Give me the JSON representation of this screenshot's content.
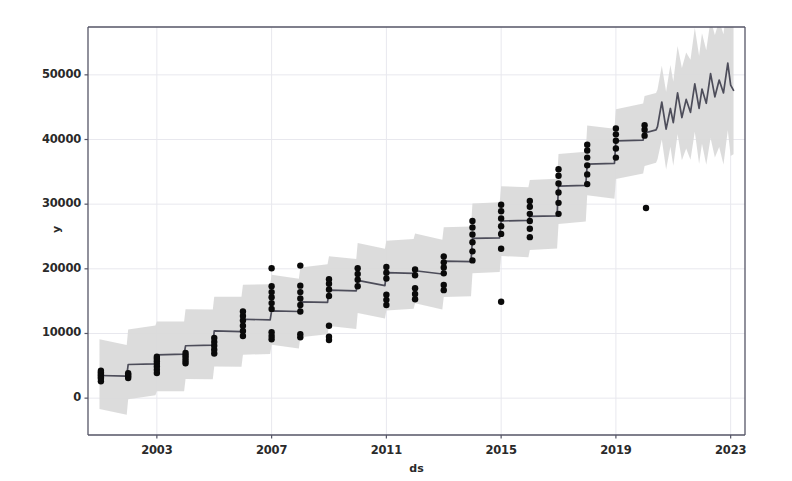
{
  "chart_data": {
    "type": "line",
    "title": "",
    "subtitle": "",
    "xlabel": "ds",
    "ylabel": "y",
    "grid": true,
    "legend_position": "none",
    "xlim": [
      2000.6,
      2023.5
    ],
    "ylim": [
      -5700,
      57400
    ],
    "xticks": [
      2003,
      2007,
      2011,
      2015,
      2019,
      2023
    ],
    "xtick_labels": [
      "2003",
      "2007",
      "2011",
      "2015",
      "2019",
      "2023"
    ],
    "yticks": [
      0,
      10000,
      20000,
      30000,
      40000,
      50000
    ],
    "ytick_labels": [
      "0",
      "10000",
      "20000",
      "30000",
      "40000",
      "50000"
    ],
    "colors": {
      "forecast_line": "#4d4d5a",
      "uncertainty_band": "#d9d9d9",
      "observed_points": "#0a0a0a",
      "grid": "#e8e8ee",
      "axis": "#555566",
      "background": "#ffffff"
    },
    "series": [
      {
        "name": "yhat",
        "kind": "step-line",
        "description": "Prophet forecast trend: annual step segments through history, then yearly-seasonal oscillation in the forecast horizon",
        "x": [
          2001.0,
          2001.95,
          2002.0,
          2002.95,
          2003.0,
          2003.95,
          2004.0,
          2004.95,
          2005.0,
          2005.95,
          2006.0,
          2006.95,
          2007.0,
          2007.95,
          2008.0,
          2008.95,
          2009.0,
          2009.95,
          2010.0,
          2010.95,
          2011.0,
          2011.95,
          2012.0,
          2012.95,
          2013.0,
          2013.95,
          2014.0,
          2014.95,
          2015.0,
          2015.95,
          2016.0,
          2016.95,
          2017.0,
          2017.95,
          2018.0,
          2018.95,
          2019.0,
          2019.95,
          2020.0,
          2020.4
        ],
        "y": [
          3500,
          3400,
          5200,
          5300,
          6700,
          6800,
          8100,
          8200,
          10400,
          10300,
          12200,
          12100,
          13500,
          13400,
          14900,
          14800,
          16700,
          16600,
          18200,
          17400,
          19400,
          19300,
          19700,
          19200,
          21200,
          21100,
          24700,
          24800,
          27400,
          27500,
          28100,
          28200,
          32800,
          32900,
          36200,
          36300,
          39800,
          39900,
          41000,
          41500
        ]
      },
      {
        "name": "yhat_forecast",
        "kind": "seasonal-line",
        "description": "Forecast extension 2020.4 to 2023.1 with repeating yearly peaks and troughs",
        "x": [
          2020.45,
          2020.6,
          2020.75,
          2020.9,
          2021.0,
          2021.15,
          2021.3,
          2021.45,
          2021.6,
          2021.75,
          2021.9,
          2022.0,
          2022.15,
          2022.3,
          2022.45,
          2022.6,
          2022.75,
          2022.9,
          2023.0,
          2023.1
        ],
        "y": [
          42000,
          45800,
          41600,
          44800,
          42600,
          47200,
          43400,
          46200,
          44200,
          48600,
          44800,
          47800,
          45600,
          50200,
          46600,
          49200,
          47200,
          51800,
          48400,
          47600
        ]
      }
    ],
    "uncertainty": {
      "name": "yhat_lower / yhat_upper",
      "band_width_low": 5400,
      "band_width_high": 5400,
      "description": "Shaded gray 80% uncertainty interval around yhat; widens noticeably in the forecast horizon after 2020.4"
    },
    "observed": {
      "name": "y (observed)",
      "marker": "filled-circle",
      "marker_size": 3.2,
      "description": "Vertical clusters of observed annual datapoints at each step boundary",
      "clusters": [
        {
          "x": 2001.05,
          "values": [
            2600,
            3000,
            3250,
            3500,
            3750,
            4000,
            4250
          ]
        },
        {
          "x": 2002.0,
          "values": [
            3100,
            3400,
            3600,
            3850
          ]
        },
        {
          "x": 2003.0,
          "values": [
            3900,
            4400,
            4900,
            5300,
            5700,
            6100,
            6400
          ]
        },
        {
          "x": 2004.0,
          "values": [
            5400,
            5800,
            6200,
            6600,
            7000
          ]
        },
        {
          "x": 2005.0,
          "values": [
            6900,
            7500,
            8100,
            8700,
            9300
          ]
        },
        {
          "x": 2006.0,
          "values": [
            9600,
            10400,
            11200,
            12000,
            12700,
            13400
          ]
        },
        {
          "x": 2007.0,
          "values": [
            9100,
            9600,
            10200,
            13800,
            14700,
            15600,
            16400,
            17300,
            20100
          ]
        },
        {
          "x": 2008.0,
          "values": [
            9400,
            9900,
            13400,
            14400,
            15400,
            16400,
            17400,
            20500
          ]
        },
        {
          "x": 2009.0,
          "values": [
            9000,
            9500,
            11200,
            15800,
            16800,
            17700,
            18400
          ]
        },
        {
          "x": 2010.0,
          "values": [
            17300,
            18300,
            19200,
            20100
          ]
        },
        {
          "x": 2011.0,
          "values": [
            14400,
            15200,
            16000,
            18500,
            19400,
            20300
          ]
        },
        {
          "x": 2012.0,
          "values": [
            15300,
            16100,
            17000,
            19000,
            19900
          ]
        },
        {
          "x": 2013.0,
          "values": [
            16700,
            17500,
            19300,
            20200,
            21000,
            21900
          ]
        },
        {
          "x": 2014.0,
          "values": [
            21300,
            22700,
            24100,
            25300,
            26400,
            27400
          ]
        },
        {
          "x": 2015.0,
          "values": [
            14900,
            23100,
            25400,
            26600,
            27800,
            28900,
            29900
          ]
        },
        {
          "x": 2016.0,
          "values": [
            24900,
            26200,
            27400,
            28500,
            29600,
            30500
          ]
        },
        {
          "x": 2017.0,
          "values": [
            28500,
            30200,
            31800,
            33200,
            34400,
            35400
          ]
        },
        {
          "x": 2018.0,
          "values": [
            33100,
            34600,
            36000,
            37200,
            38300,
            39200
          ]
        },
        {
          "x": 2019.0,
          "values": [
            37200,
            38600,
            39800,
            40800,
            41700
          ]
        },
        {
          "x": 2020.0,
          "values": [
            40600,
            41500,
            42200
          ]
        }
      ],
      "outliers": [
        {
          "x": 2020.05,
          "y": 29400
        }
      ]
    }
  }
}
